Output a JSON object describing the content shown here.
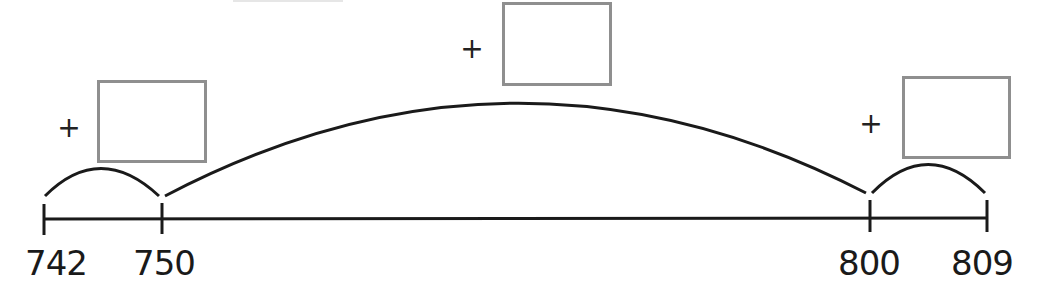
{
  "number_line": {
    "ticks": [
      {
        "value": "742",
        "x": 44
      },
      {
        "value": "750",
        "x": 162
      },
      {
        "value": "800",
        "x": 870
      },
      {
        "value": "809",
        "x": 987
      }
    ],
    "line_color": "#1a1a1a"
  },
  "jumps": [
    {
      "from": "742",
      "to": "750",
      "operator": "+",
      "answer": ""
    },
    {
      "from": "750",
      "to": "800",
      "operator": "+",
      "answer": ""
    },
    {
      "from": "800",
      "to": "809",
      "operator": "+",
      "answer": ""
    }
  ],
  "colors": {
    "box_border": "#8f8f8f",
    "stroke": "#1a1a1a"
  }
}
